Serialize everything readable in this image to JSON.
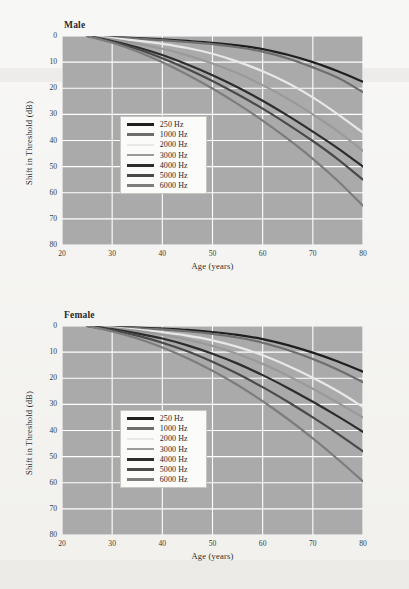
{
  "figure": {
    "background_color": "#efeeea",
    "plot_fill_color": "#aaaaaa",
    "gridline_color": "#ffffff",
    "text_color": "#2b2b2b"
  },
  "legend": {
    "title": "",
    "entries": [
      {
        "label": "250 Hz",
        "color": "#1f1f1f"
      },
      {
        "label": "1000 Hz",
        "color": "#6e6e6e"
      },
      {
        "label": "2000 Hz",
        "color": "#e8e8e8"
      },
      {
        "label": "3000 Hz",
        "color": "#9a9a9a"
      },
      {
        "label": "4000 Hz",
        "color": "#2d2d2d"
      },
      {
        "label": "5000 Hz",
        "color": "#4a4a4a"
      },
      {
        "label": "6000 Hz",
        "color": "#7d7d7d"
      }
    ]
  },
  "chart_data": [
    {
      "type": "line",
      "title": "Male",
      "xlabel": "Age (years)",
      "ylabel": "Shift in Threshold (dB)",
      "xlim": [
        20,
        80
      ],
      "ylim": [
        0,
        80
      ],
      "y_inverted": true,
      "xticks": [
        20,
        30,
        40,
        50,
        60,
        70,
        80
      ],
      "yticks": [
        0,
        10,
        20,
        30,
        40,
        50,
        60,
        70,
        80
      ],
      "grid": true,
      "legend_position": "inside-left",
      "x": [
        25,
        30,
        35,
        40,
        45,
        50,
        55,
        60,
        65,
        70,
        75,
        80
      ],
      "series": [
        {
          "name": "250 Hz",
          "color": "#1f1f1f",
          "values": [
            0,
            0.4,
            0.8,
            1.3,
            1.9,
            2.6,
            3.6,
            5.0,
            7.2,
            10.0,
            13.5,
            17.5
          ]
        },
        {
          "name": "1000 Hz",
          "color": "#6e6e6e",
          "values": [
            0,
            0.5,
            1.0,
            1.6,
            2.3,
            3.1,
            4.3,
            6.0,
            8.6,
            12.0,
            16.0,
            21.5
          ]
        },
        {
          "name": "2000 Hz",
          "color": "#e8e8e8",
          "values": [
            0,
            0.8,
            1.8,
            3.0,
            4.6,
            6.8,
            9.8,
            13.5,
            18.0,
            23.5,
            30.0,
            37.0
          ]
        },
        {
          "name": "3000 Hz",
          "color": "#9a9a9a",
          "values": [
            0,
            1.3,
            2.9,
            4.9,
            7.4,
            10.5,
            14.3,
            18.8,
            24.0,
            30.0,
            36.5,
            44.0
          ]
        },
        {
          "name": "4000 Hz",
          "color": "#2d2d2d",
          "values": [
            0,
            1.9,
            4.3,
            7.3,
            10.9,
            15.0,
            19.6,
            24.8,
            30.5,
            36.6,
            43.0,
            50.0
          ]
        },
        {
          "name": "5000 Hz",
          "color": "#4a4a4a",
          "values": [
            0,
            2.2,
            5.0,
            8.5,
            12.6,
            17.2,
            22.3,
            27.8,
            33.8,
            40.2,
            47.2,
            55.0
          ]
        },
        {
          "name": "6000 Hz",
          "color": "#7d7d7d",
          "values": [
            0,
            2.6,
            5.9,
            10.0,
            14.8,
            20.1,
            26.0,
            32.4,
            39.4,
            47.0,
            55.5,
            65.0
          ]
        }
      ]
    },
    {
      "type": "line",
      "title": "Female",
      "xlabel": "Age (years)",
      "ylabel": "Shift in Threshold (dB)",
      "xlim": [
        20,
        80
      ],
      "ylim": [
        0,
        80
      ],
      "y_inverted": true,
      "xticks": [
        20,
        30,
        40,
        50,
        60,
        70,
        80
      ],
      "yticks": [
        0,
        10,
        20,
        30,
        40,
        50,
        60,
        70,
        80
      ],
      "grid": true,
      "legend_position": "inside-left",
      "x": [
        25,
        30,
        35,
        40,
        45,
        50,
        55,
        60,
        65,
        70,
        75,
        80
      ],
      "series": [
        {
          "name": "250 Hz",
          "color": "#1f1f1f",
          "values": [
            0,
            0.3,
            0.6,
            1.0,
            1.5,
            2.3,
            3.4,
            5.0,
            7.3,
            10.2,
            13.6,
            17.5
          ]
        },
        {
          "name": "1000 Hz",
          "color": "#6e6e6e",
          "values": [
            0,
            0.4,
            0.8,
            1.3,
            2.0,
            3.0,
            4.4,
            6.4,
            9.2,
            12.6,
            16.7,
            21.5
          ]
        },
        {
          "name": "2000 Hz",
          "color": "#e8e8e8",
          "values": [
            0,
            0.6,
            1.4,
            2.4,
            3.7,
            5.5,
            8.0,
            11.2,
            15.2,
            19.8,
            25.0,
            31.0
          ]
        },
        {
          "name": "3000 Hz",
          "color": "#9a9a9a",
          "values": [
            0,
            0.8,
            1.9,
            3.3,
            5.2,
            7.6,
            10.7,
            14.5,
            19.0,
            24.0,
            29.4,
            35.0
          ]
        },
        {
          "name": "4000 Hz",
          "color": "#2d2d2d",
          "values": [
            0,
            1.2,
            2.8,
            4.8,
            7.4,
            10.6,
            14.4,
            18.8,
            23.7,
            29.0,
            34.6,
            40.5
          ]
        },
        {
          "name": "5000 Hz",
          "color": "#4a4a4a",
          "values": [
            0,
            1.6,
            3.7,
            6.4,
            9.7,
            13.7,
            18.3,
            23.4,
            29.0,
            35.0,
            41.3,
            48.0
          ]
        },
        {
          "name": "6000 Hz",
          "color": "#7d7d7d",
          "values": [
            0,
            2.1,
            4.8,
            8.2,
            12.3,
            17.1,
            22.6,
            28.8,
            35.6,
            43.0,
            51.0,
            59.5
          ]
        }
      ]
    }
  ]
}
